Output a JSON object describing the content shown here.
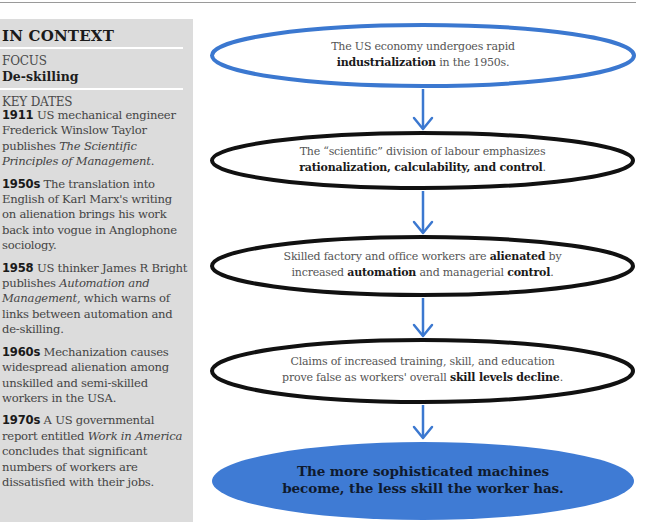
{
  "colors": {
    "accent_blue": "#3b78d0",
    "sidebar_bg": "#dcdcdc",
    "outline_black": "#111111",
    "final_fill": "#3f7bd4"
  },
  "sidebar": {
    "heading": "IN CONTEXT",
    "focus_label": "FOCUS",
    "focus_value": "De-skilling",
    "key_dates_label": "KEY DATES",
    "entries": [
      {
        "year": "1911",
        "parts": [
          {
            "text": " US mechanical engineer Frederick Winslow Taylor publishes ",
            "italic": false
          },
          {
            "text": "The Scientific Principles of Management",
            "italic": true
          },
          {
            "text": ".",
            "italic": false
          }
        ]
      },
      {
        "year": "1950s",
        "parts": [
          {
            "text": " The translation into English of Karl Marx's writing on alienation brings his work back into vogue in Anglophone sociology.",
            "italic": false
          }
        ]
      },
      {
        "year": "1958",
        "parts": [
          {
            "text": " US thinker James R Bright publishes ",
            "italic": false
          },
          {
            "text": "Automation and Management",
            "italic": true
          },
          {
            "text": ", which warns of links between automation and de-skilling.",
            "italic": false
          }
        ]
      },
      {
        "year": "1960s",
        "parts": [
          {
            "text": " Mechanization causes widespread alienation among unskilled and semi-skilled workers in the USA.",
            "italic": false
          }
        ]
      },
      {
        "year": "1970s",
        "parts": [
          {
            "text": " A US governmental report entitled ",
            "italic": false
          },
          {
            "text": "Work in America",
            "italic": true
          },
          {
            "text": " concludes that significant numbers of workers are dissatisfied with their jobs.",
            "italic": false
          }
        ]
      }
    ]
  },
  "flowchart": {
    "nodes": [
      {
        "style": "blue-outline",
        "lines": [
          [
            {
              "text": "The US economy undergoes rapid",
              "bold": false
            }
          ],
          [
            {
              "text": "industrialization",
              "bold": true
            },
            {
              "text": " in the 1950s.",
              "bold": false
            }
          ]
        ]
      },
      {
        "style": "black-outline",
        "lines": [
          [
            {
              "text": "The “scientific” division of labour emphasizes",
              "bold": false
            }
          ],
          [
            {
              "text": "rationalization, calculability, and control",
              "bold": true
            },
            {
              "text": ".",
              "bold": false
            }
          ]
        ]
      },
      {
        "style": "black-outline",
        "lines": [
          [
            {
              "text": "Skilled factory and office workers are ",
              "bold": false
            },
            {
              "text": "alienated",
              "bold": true
            },
            {
              "text": " by",
              "bold": false
            }
          ],
          [
            {
              "text": "increased ",
              "bold": false
            },
            {
              "text": "automation",
              "bold": true
            },
            {
              "text": " and managerial ",
              "bold": false
            },
            {
              "text": "control",
              "bold": true
            },
            {
              "text": ".",
              "bold": false
            }
          ]
        ]
      },
      {
        "style": "black-outline",
        "lines": [
          [
            {
              "text": "Claims of increased training, skill, and education",
              "bold": false
            }
          ],
          [
            {
              "text": "prove false as workers' overall ",
              "bold": false
            },
            {
              "text": "skill levels decline",
              "bold": true
            },
            {
              "text": ".",
              "bold": false
            }
          ]
        ]
      },
      {
        "style": "blue-filled",
        "lines": [
          [
            {
              "text": "The more sophisticated machines",
              "bold": true
            }
          ],
          [
            {
              "text": "become, the less skill the worker has.",
              "bold": true
            }
          ]
        ]
      }
    ],
    "arrows": [
      "arrow-down",
      "arrow-down",
      "arrow-down",
      "arrow-down"
    ]
  }
}
